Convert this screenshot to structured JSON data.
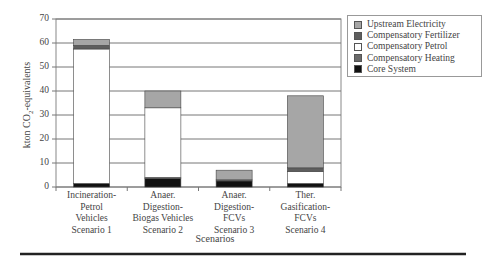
{
  "chart_data": {
    "type": "bar",
    "stacked": true,
    "title": "",
    "xlabel": "Scenarios",
    "ylabel": "kton CO2-equivalents",
    "ylim": [
      0,
      70
    ],
    "yticks": [
      0,
      10,
      20,
      30,
      40,
      50,
      60,
      70
    ],
    "grid": true,
    "legend_position": "right",
    "categories": [
      [
        "Incineration-",
        "Petrol",
        "Vehicles",
        "Scenario 1"
      ],
      [
        "Anaer.",
        "Digestion-",
        "Biogas Vehicles",
        "Scenario 2"
      ],
      [
        "Anaer.",
        "Digestion-",
        "FCVs",
        "Scenario 3"
      ],
      [
        "Ther.",
        "Gasification-",
        "FCVs",
        "Scenario 4"
      ]
    ],
    "series": [
      {
        "name": "Core System",
        "color": "#111111",
        "values": [
          1.5,
          3.5,
          2.5,
          1.5
        ]
      },
      {
        "name": "Compensatory Heating",
        "color": "#6a6a6a",
        "values": [
          0.0,
          0.5,
          0.5,
          0.0
        ]
      },
      {
        "name": "Compensatory Petrol",
        "color": "#ffffff",
        "values": [
          56.0,
          29.0,
          0.0,
          5.0
        ]
      },
      {
        "name": "Compensatory Fertilizer",
        "color": "#5e5e5e",
        "values": [
          1.5,
          0.0,
          0.0,
          1.5
        ]
      },
      {
        "name": "Upstream Electricity",
        "color": "#a6a6a6",
        "values": [
          2.5,
          7.0,
          4.0,
          30.0
        ]
      }
    ],
    "totals": [
      61.5,
      40.0,
      7.0,
      38.0
    ]
  },
  "legend": {
    "items": [
      {
        "label": "Upstream Electricity",
        "color": "#a6a6a6"
      },
      {
        "label": "Compensatory Fertilizer",
        "color": "#5e5e5e"
      },
      {
        "label": "Compensatory Petrol",
        "color": "#ffffff"
      },
      {
        "label": "Compensatory Heating",
        "color": "#6a6a6a"
      },
      {
        "label": "Core System",
        "color": "#111111"
      }
    ]
  },
  "axes": {
    "ylabel_main": "kton CO",
    "ylabel_sub": "2",
    "ylabel_rest": "-equivalents",
    "xlabel": "Scenarios"
  }
}
